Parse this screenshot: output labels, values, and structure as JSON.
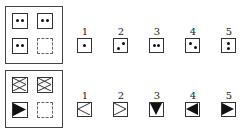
{
  "puzzles": [
    {
      "name": "dots-puzzle",
      "matrix": [
        "two-dots-horizontal",
        "two-dots-horizontal",
        "two-dots-horizontal",
        "missing"
      ],
      "options": [
        {
          "label": "1",
          "figure": "one-dot-center"
        },
        {
          "label": "2",
          "figure": "two-dots-diagonal"
        },
        {
          "label": "3",
          "figure": "two-dots-horizontal"
        },
        {
          "label": "4",
          "figure": "two-dots-diagonal-down"
        },
        {
          "label": "5",
          "figure": "two-dots-vertical"
        }
      ]
    },
    {
      "name": "triangles-puzzle",
      "matrix": [
        "x-outline-crossed-box",
        "x-outline-crossed-box",
        "filled-triangle-right",
        "missing"
      ],
      "options": [
        {
          "label": "1",
          "figure": "outline-triangle-left"
        },
        {
          "label": "2",
          "figure": "outline-triangle-right"
        },
        {
          "label": "3",
          "figure": "filled-triangle-down"
        },
        {
          "label": "4",
          "figure": "filled-triangle-left"
        },
        {
          "label": "5",
          "figure": "filled-triangle-right"
        }
      ]
    }
  ]
}
